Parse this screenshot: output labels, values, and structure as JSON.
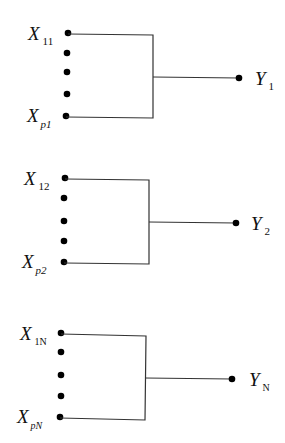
{
  "diagram": {
    "type": "many-to-one mapping groups",
    "groups": [
      {
        "id": "group-1",
        "input_top": {
          "var": "X",
          "sub": "11",
          "sub_italic": false
        },
        "input_bottom": {
          "var": "X",
          "sub": "p1",
          "sub_italic": true
        },
        "ellipsis_dots": 3,
        "output": {
          "var": "Y",
          "sub": "1"
        }
      },
      {
        "id": "group-2",
        "input_top": {
          "var": "X",
          "sub": "12",
          "sub_italic": false
        },
        "input_bottom": {
          "var": "X",
          "sub": "p2",
          "sub_italic": true
        },
        "ellipsis_dots": 3,
        "output": {
          "var": "Y",
          "sub": "2"
        }
      },
      {
        "id": "group-N",
        "input_top": {
          "var": "X",
          "sub": "1N",
          "sub_italic": false
        },
        "input_bottom": {
          "var": "X",
          "sub": "pN",
          "sub_italic": true
        },
        "ellipsis_dots": 3,
        "output": {
          "var": "Y",
          "sub": "N"
        }
      }
    ]
  }
}
